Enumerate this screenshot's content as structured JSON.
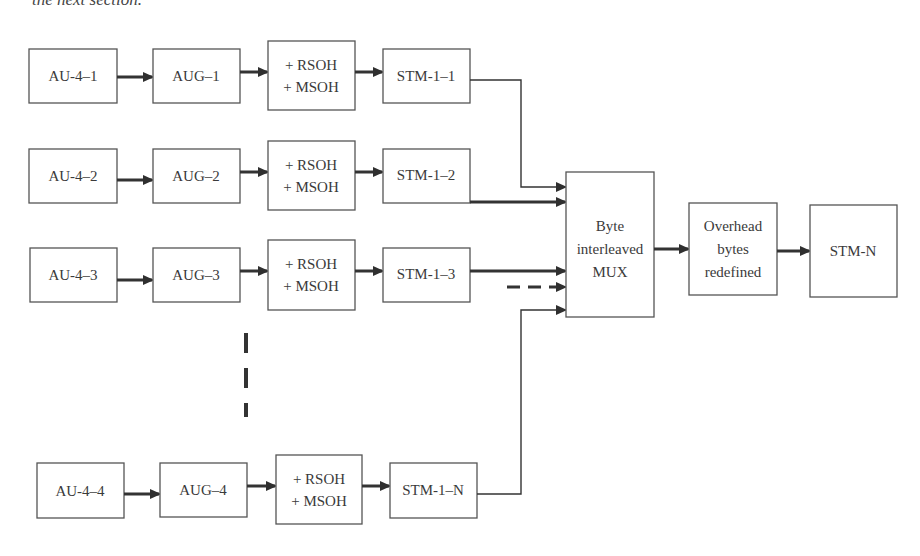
{
  "page": {
    "cutoff_text": "the next section."
  },
  "diagram": {
    "rows": [
      {
        "au": "AU-4–1",
        "aug": "AUG–1",
        "oh_line1": "+ RSOH",
        "oh_line2": "+ MSOH",
        "stm": "STM-1–1"
      },
      {
        "au": "AU-4–2",
        "aug": "AUG–2",
        "oh_line1": "+ RSOH",
        "oh_line2": "+ MSOH",
        "stm": "STM-1–2"
      },
      {
        "au": "AU-4–3",
        "aug": "AUG–3",
        "oh_line1": "+ RSOH",
        "oh_line2": "+ MSOH",
        "stm": "STM-1–3"
      },
      {
        "au": "AU-4–4",
        "aug": "AUG–4",
        "oh_line1": "+ RSOH",
        "oh_line2": "+ MSOH",
        "stm": "STM-1–N"
      }
    ],
    "mux": {
      "line1": "Byte",
      "line2": "interleaved",
      "line3": "MUX"
    },
    "overhead": {
      "line1": "Overhead",
      "line2": "bytes",
      "line3": "redefined"
    },
    "output": {
      "label": "STM-N"
    },
    "colors": {
      "stroke": "#333333",
      "box_border": "#555555",
      "text": "#3a3a3a",
      "background": "#ffffff"
    }
  }
}
